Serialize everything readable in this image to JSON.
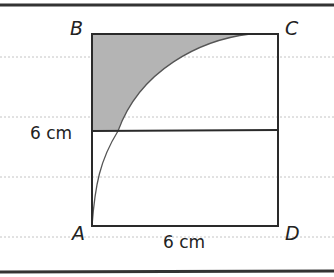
{
  "figure": {
    "vertices": {
      "A": "A",
      "B": "B",
      "C": "C",
      "D": "D"
    },
    "dimensions": {
      "left_side": "6 cm",
      "bottom_side": "6 cm"
    },
    "colors": {
      "shade": "#b4b4b4",
      "line": "#2a2a2a",
      "ruled": "#bdbdbd"
    }
  }
}
